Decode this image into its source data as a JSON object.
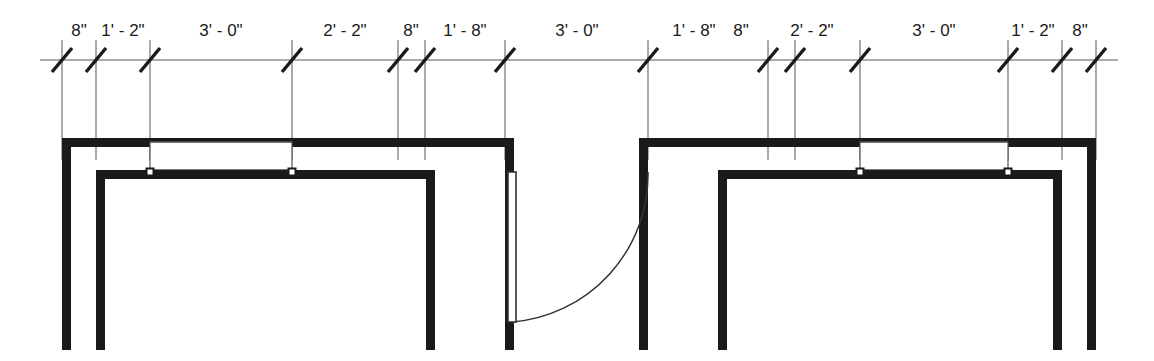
{
  "drawing": {
    "title": "Architectural Floor Plan Segment",
    "units": "feet-inches",
    "line_color": "#1a1a1a",
    "thin_line_color": "#555555",
    "background_color": "#ffffff"
  },
  "dimension_string": {
    "name": "overall-dimension-chain",
    "baseline_y": 60,
    "tick_positions": [
      62,
      96,
      150,
      292,
      398,
      425,
      505,
      648,
      768,
      795,
      860,
      1008,
      1062,
      1096
    ],
    "segments": [
      {
        "label": "8\"",
        "x_start": 62,
        "x_end": 96,
        "text_x": 79,
        "text_y": 36
      },
      {
        "label": "1' - 2\"",
        "x_start": 96,
        "x_end": 150,
        "text_x": 123,
        "text_y": 36
      },
      {
        "label": "3' - 0\"",
        "x_start": 150,
        "x_end": 292,
        "text_x": 221,
        "text_y": 36
      },
      {
        "label": "2' - 2\"",
        "x_start": 292,
        "x_end": 398,
        "text_x": 345,
        "text_y": 36
      },
      {
        "label": "8\"",
        "x_start": 398,
        "x_end": 425,
        "text_x": 411,
        "text_y": 36
      },
      {
        "label": "1' - 8\"",
        "x_start": 425,
        "x_end": 505,
        "text_x": 465,
        "text_y": 36
      },
      {
        "label": "3' - 0\"",
        "x_start": 505,
        "x_end": 648,
        "text_x": 577,
        "text_y": 36
      },
      {
        "label": "1' - 8\"",
        "x_start": 648,
        "x_end": 768,
        "text_x": 694,
        "text_y": 36
      },
      {
        "label": "8\"",
        "x_start": 768,
        "x_end": 795,
        "text_x": 741,
        "text_y": 36
      },
      {
        "label": "2' - 2\"",
        "x_start": 795,
        "x_end": 860,
        "text_x": 812,
        "text_y": 36
      },
      {
        "label": "3' - 0\"",
        "x_start": 860,
        "x_end": 1008,
        "text_x": 934,
        "text_y": 36
      },
      {
        "label": "1' - 2\"",
        "x_start": 1008,
        "x_end": 1062,
        "text_x": 1033,
        "text_y": 36
      },
      {
        "label": "8\"",
        "x_start": 1062,
        "x_end": 1096,
        "text_x": 1080,
        "text_y": 36
      }
    ]
  },
  "extension_lines": {
    "name": "extension-lines",
    "top_y": 40,
    "bottom_y": 160,
    "x_positions": [
      62,
      96,
      150,
      292,
      398,
      425,
      505,
      648,
      768,
      795,
      860,
      1008,
      1062,
      1096
    ]
  },
  "geometry": {
    "wall_outer_top_y": 138,
    "wall_inner_top_y": 170,
    "wall_bottom_y": 350,
    "wall_thickness": 9,
    "left_wall_outer_x": 62,
    "left_wall_inner_x": 96,
    "right_wall_outer_x": 1096,
    "right_wall_inner_x": 1062,
    "opening_left_x": 505,
    "opening_right_x": 648
  },
  "windows": [
    {
      "name": "window-left",
      "x_start": 150,
      "x_end": 292,
      "outer_y": 140,
      "inner_y": 170,
      "marker_size": 7
    },
    {
      "name": "window-right",
      "x_start": 860,
      "x_end": 1008,
      "outer_y": 140,
      "inner_y": 170,
      "marker_size": 7
    }
  ],
  "door": {
    "name": "swing-door",
    "hinge_x": 648,
    "hinge_y": 172,
    "panel_x": 508,
    "panel_y_top": 172,
    "panel_y_bottom": 322,
    "panel_thickness": 8,
    "swing_radius": 148,
    "swing_direction": "counter-clockwise"
  }
}
